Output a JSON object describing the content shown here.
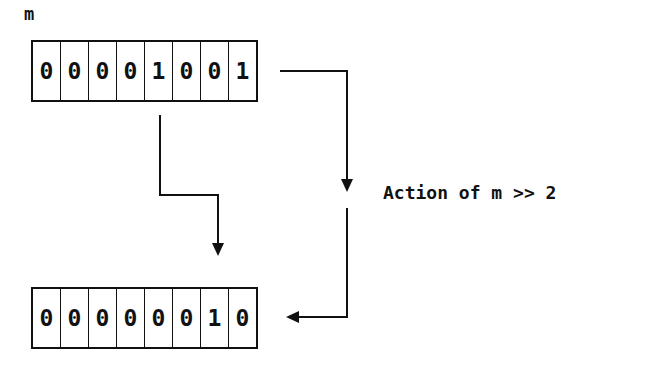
{
  "diagram": {
    "variable_label": "m",
    "input_register": {
      "name": "m",
      "bits": [
        "0",
        "0",
        "0",
        "0",
        "1",
        "0",
        "0",
        "1"
      ]
    },
    "output_register": {
      "bits": [
        "0",
        "0",
        "0",
        "0",
        "0",
        "0",
        "1",
        "0"
      ]
    },
    "operation_label": "Action of m >> 2",
    "colors": {
      "stroke": "#111111",
      "background": "#ffffff"
    }
  }
}
